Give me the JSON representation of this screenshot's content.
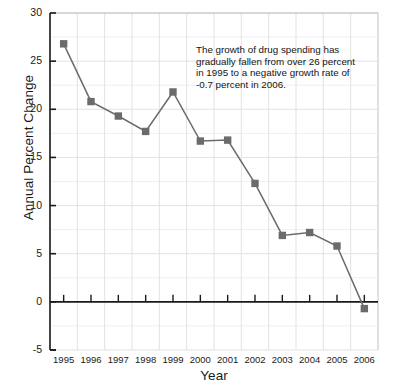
{
  "figure": {
    "background": "#ffffff",
    "series_color": "#6b6b6b",
    "axis_color": "#1a1a1a",
    "grid_color": "#e2e2e2"
  },
  "annotation": {
    "lines": [
      "The growth of drug spending has",
      "gradually fallen from over 26 percent",
      "in 1995 to a negative growth rate of",
      "-0.7 percent in 2006."
    ]
  },
  "chart_data": {
    "type": "line",
    "title": "",
    "xlabel": "Year",
    "ylabel": "Annual Percent Change",
    "categories": [
      "1995",
      "1996",
      "1997",
      "1998",
      "1999",
      "2000",
      "2001",
      "2002",
      "2003",
      "2004",
      "2005",
      "2006"
    ],
    "values": [
      26.8,
      20.8,
      19.3,
      17.7,
      21.8,
      16.7,
      16.8,
      12.3,
      6.9,
      7.2,
      5.8,
      -0.7
    ],
    "ylim": [
      -5,
      30
    ],
    "yticks": [
      "30",
      "25",
      "20",
      "15",
      "10",
      "5",
      "0",
      "-5"
    ],
    "ytick_values": [
      30,
      25,
      20,
      15,
      10,
      5,
      0,
      -5
    ],
    "grid": true,
    "legend": "none",
    "marker": "square",
    "zero_line": true
  }
}
